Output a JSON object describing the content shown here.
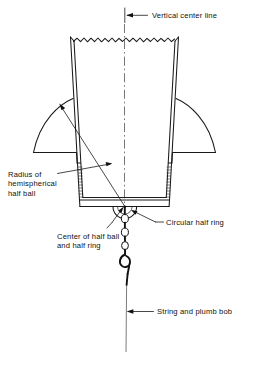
{
  "figure": {
    "type": "engineering-cross-section-diagram",
    "background_color": "#ffffff",
    "line_color": "#111111"
  },
  "labels": {
    "vertical_center_line": "Vertical center line",
    "radius_line_1": "Radius of",
    "radius_line_2": "hemispherical",
    "radius_line_3": "half ball",
    "center_line_1": "Center of half ball",
    "center_line_2": "and half ring",
    "circular_half_ring": "Circular half ring",
    "string_and_plumb_bob": "String and plumb bob"
  },
  "parts": {
    "bucket": "tapered-bucket-body",
    "break_line": "jagged-break-line-top",
    "flange_left": "left-conical-flange",
    "flange_right": "right-conical-flange",
    "base_plate": "bucket-base-plate",
    "half_ball": "hemispherical-half-ball",
    "half_ring": "circular-half-ring",
    "chain": "bead-chain",
    "hook": "hook",
    "string": "plumb-bob-string"
  }
}
